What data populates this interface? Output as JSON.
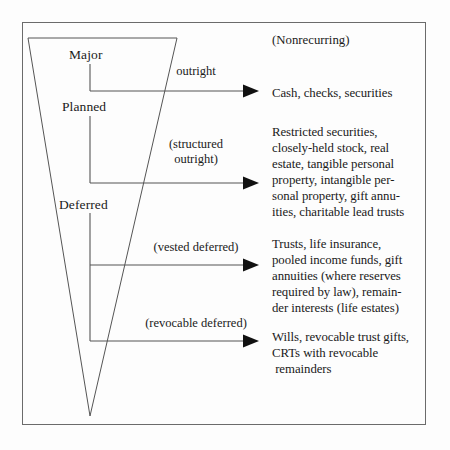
{
  "diagram": {
    "frame": {
      "stroke_color": "#6b6b6b",
      "background": "#fdfdfd"
    },
    "funnel": {
      "name": "inverted-triangle-funnel",
      "stroke_color": "#555555",
      "top_left_x": 28,
      "top_right_x": 177,
      "top_y": 38,
      "apex_x": 90,
      "apex_y": 416
    },
    "axis": {
      "name": "vertical-continuum-axis",
      "x": 90,
      "color": "#555555"
    },
    "stage_labels": [
      {
        "id": "major",
        "text": "Major",
        "x": 95,
        "y": 51
      },
      {
        "id": "planned",
        "text": "Planned",
        "x": 82,
        "y": 103
      },
      {
        "id": "deferred",
        "text": "Deferred",
        "x": 79,
        "y": 201
      }
    ],
    "note": {
      "text": "(Nonrecurring)",
      "x": 275,
      "y": 36
    },
    "arrows": [
      {
        "id": "outright",
        "caption": "outright",
        "caption_x": 195,
        "caption_y": 68,
        "y": 91,
        "x_start": 90,
        "x_end": 258
      },
      {
        "id": "structured-outright",
        "caption": "(structured\noutright)",
        "caption_x": 196,
        "caption_y": 140,
        "y": 183,
        "x_start": 90,
        "x_end": 258
      },
      {
        "id": "vested-deferred",
        "caption": "(vested deferred)",
        "caption_x": 196,
        "caption_y": 243,
        "y": 265,
        "x_start": 90,
        "x_end": 258
      },
      {
        "id": "revocable-deferred",
        "caption": "(revocable deferred)",
        "caption_x": 196,
        "caption_y": 319,
        "y": 341,
        "x_start": 90,
        "x_end": 258
      }
    ],
    "results": [
      {
        "id": "result-outright",
        "x": 272,
        "y": 85,
        "text": "Cash, checks, securities"
      },
      {
        "id": "result-structured-outright",
        "x": 272,
        "y": 127,
        "text": "Restricted securities,\nclosely-held stock, real\nestate, tangible personal\nproperty, intangible per-\nsonal property, gift annu-\nities, charitable lead trusts"
      },
      {
        "id": "result-vested-deferred",
        "x": 272,
        "y": 238,
        "text": "Trusts, life insurance,\npooled income funds, gift\nannuities (where reserves\nrequired by law), remain-\nder interests (life estates)"
      },
      {
        "id": "result-revocable-deferred",
        "x": 272,
        "y": 331,
        "text": "Wills, revocable trust gifts,\nCRTs with revocable\n remainders"
      }
    ]
  }
}
